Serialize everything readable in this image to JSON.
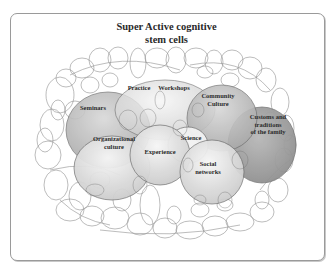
{
  "title": {
    "line1": "Super Active cognitive",
    "line2": "stem cells"
  },
  "colors": {
    "frame_border": "#9a9a9a",
    "circle_stroke": "#6a6a6a",
    "dark_fill": "#9c9c9c",
    "mid_fill": "#bdbdbd",
    "light_fill": "#e6e6e6",
    "text": "#2b2b2b"
  },
  "nodes": [
    {
      "id": "seminars",
      "label_lines": [
        "Seminars"
      ]
    },
    {
      "id": "practice",
      "label_lines": [
        "Practice"
      ]
    },
    {
      "id": "workshops",
      "label_lines": [
        "Workshops"
      ]
    },
    {
      "id": "community-culture",
      "label_lines": [
        "Community",
        "Culture"
      ]
    },
    {
      "id": "customs-traditions",
      "label_lines": [
        "Customs and",
        "traditions",
        "of the family"
      ]
    },
    {
      "id": "organizational-culture",
      "label_lines": [
        "Organizational",
        "culture"
      ]
    },
    {
      "id": "science",
      "label_lines": [
        "Science"
      ]
    },
    {
      "id": "experience",
      "label_lines": [
        "Experience"
      ]
    },
    {
      "id": "social-networks",
      "label_lines": [
        "Social",
        "networks"
      ]
    }
  ]
}
